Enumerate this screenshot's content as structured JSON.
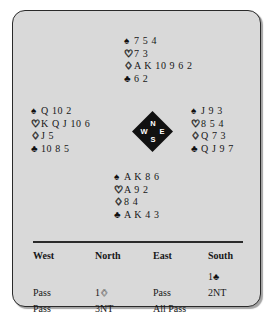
{
  "suits": {
    "spade": "♠",
    "heart": "♡",
    "diamond": "♢",
    "club": "♣"
  },
  "hands": {
    "north": {
      "label": "North",
      "spades": "7 5 4",
      "hearts": "7 3",
      "diamonds": "A K 10 9 6 2",
      "clubs": "6 2"
    },
    "west": {
      "label": "West",
      "spades": "Q 10 2",
      "hearts": "K Q J 10 6",
      "diamonds": "J 5",
      "clubs": "10 8 5"
    },
    "east": {
      "label": "East",
      "spades": "J 9 3",
      "hearts": "8 5 4",
      "diamonds": "Q 7 3",
      "clubs": "Q J 9 7"
    },
    "south": {
      "label": "South",
      "spades": "A K 8 6",
      "hearts": "A 9 2",
      "diamonds": "8 4",
      "clubs": "A K 4 3"
    }
  },
  "compass": {
    "north": "N",
    "south": "S",
    "west": "W",
    "east": "E"
  },
  "auction": {
    "headers": [
      "West",
      "North",
      "East",
      "South"
    ],
    "rows": [
      {
        "west": "",
        "north": "",
        "east": "",
        "south_level": "1",
        "south_suit": "club",
        "south": ""
      },
      {
        "west": "Pass",
        "north_level": "1",
        "north_suit": "diamond",
        "north": "",
        "east": "Pass",
        "south": "2NT"
      },
      {
        "west": "Pass",
        "north": "3NT",
        "east": "All Pass",
        "south": ""
      }
    ]
  }
}
